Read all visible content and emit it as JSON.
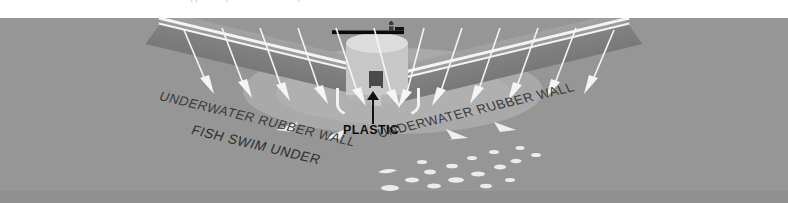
{
  "caption": {
    "text": "supported by the Ocean Cleanup foundation  ·  Environmental Charter"
  },
  "diagram": {
    "labels": {
      "wall_left": "UNDERWATER RUBBER WALL",
      "wall_right": "UNDERWATER RUBBER WALL",
      "fish": "FISH SWIM UNDER",
      "plastic": "PLASTIC"
    },
    "icons": {
      "vessel": "ship-icon",
      "tower": "collection-tower-icon",
      "flow": "current-flow-arrow-icon",
      "debris": "plastic-debris-icon"
    },
    "colors": {
      "ocean": "#969696",
      "boom": "#8a8a8a",
      "rail": "#f4f4f4",
      "tower": "#c7c7c7",
      "label_dark": "#3a3a3a",
      "callout": "#0d0d0d"
    }
  },
  "flow_arrows": {
    "left_count": 6,
    "right_count": 6,
    "direction_left": "down-right",
    "direction_right": "down-left"
  },
  "debris": {
    "count": 22
  }
}
